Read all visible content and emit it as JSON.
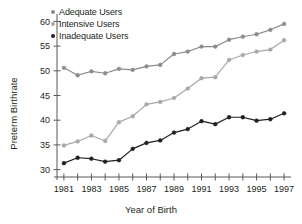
{
  "chart_data": {
    "type": "line",
    "title": "",
    "xlabel": "Year of Birth",
    "ylabel": "Preterm Birthrate",
    "x": [
      1981,
      1982,
      1983,
      1984,
      1985,
      1986,
      1987,
      1988,
      1989,
      1990,
      1991,
      1992,
      1993,
      1994,
      1995,
      1996,
      1997
    ],
    "xlim": [
      1980.5,
      1997.5
    ],
    "ylim": [
      28.5,
      61.5
    ],
    "yticks": [
      30,
      35,
      40,
      45,
      50,
      55,
      60
    ],
    "xticks": [
      1981,
      1982,
      1983,
      1984,
      1985,
      1986,
      1987,
      1988,
      1989,
      1990,
      1991,
      1992,
      1993,
      1994,
      1995,
      1996,
      1997
    ],
    "xtick_labels_shown": [
      1981,
      1983,
      1985,
      1987,
      1989,
      1991,
      1993,
      1995,
      1997
    ],
    "grid": false,
    "legend_position": "top-left",
    "series": [
      {
        "name": "Adequate Users",
        "color": "#8c8c8c",
        "values": [
          50.6,
          49.1,
          49.9,
          49.5,
          50.4,
          50.2,
          50.9,
          51.2,
          53.4,
          53.9,
          54.9,
          54.9,
          56.3,
          56.9,
          57.4,
          58.3,
          59.5
        ]
      },
      {
        "name": "Intensive Users",
        "color": "#a8a8a8",
        "values": [
          34.9,
          35.7,
          36.9,
          35.8,
          39.6,
          40.8,
          43.2,
          43.7,
          44.5,
          46.4,
          48.5,
          48.7,
          52.2,
          53.2,
          53.9,
          54.3,
          56.2
        ]
      },
      {
        "name": "Inadequate Users",
        "color": "#231f20",
        "values": [
          31.3,
          32.4,
          32.2,
          31.6,
          31.9,
          34.2,
          35.4,
          35.9,
          37.5,
          38.2,
          39.8,
          39.2,
          40.6,
          40.6,
          39.9,
          40.2,
          41.4
        ]
      }
    ]
  },
  "legend": {
    "items": [
      {
        "label": "Adequate Users",
        "color": "#8c8c8c"
      },
      {
        "label": "Intensive Users",
        "color": "#a8a8a8"
      },
      {
        "label": "Inadequate Users",
        "color": "#231f20"
      }
    ]
  },
  "axes": {
    "x_title": "Year of Birth",
    "y_title": "Preterm Birthrate"
  }
}
